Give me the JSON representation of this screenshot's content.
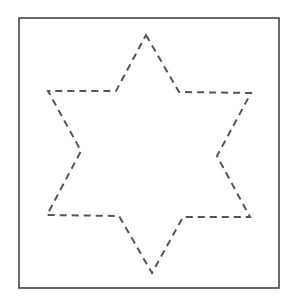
{
  "figure": {
    "shape": "six-pointed-star",
    "outline_style": "dashed",
    "frame_color": "#3a3a3a",
    "stroke_color": "#555555",
    "background_color": "#ffffff"
  }
}
